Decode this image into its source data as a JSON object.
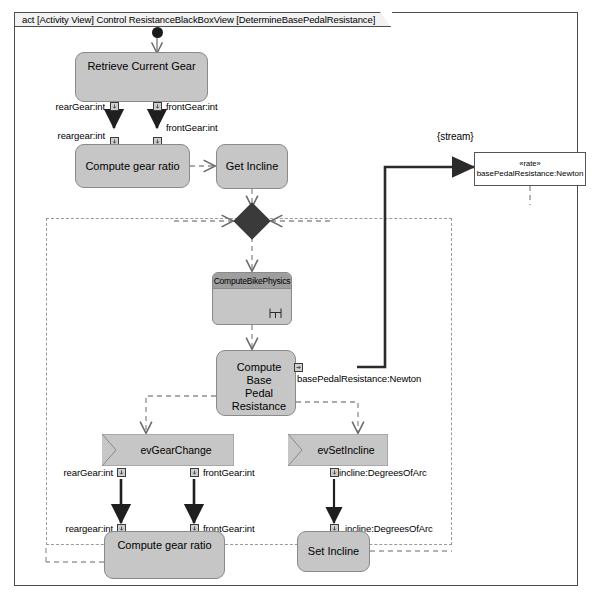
{
  "frame": {
    "label": "act [Activity View] Control ResistanceBlackBoxView [DetermineBasePedalResistance]"
  },
  "nodes": {
    "retrieve_current_gear": "Retrieve Current Gear",
    "compute_gear_ratio_top": "Compute gear ratio",
    "get_incline": "Get Incline",
    "compute_bike_physics": "ComputeBikePhysics",
    "compute_base_pedal_resistance": "Compute Base\nPedal Resistance",
    "compute_base_pedal_resistance_line1": "Compute Base",
    "compute_base_pedal_resistance_line2": "Pedal Resistance",
    "ev_gear_change": "evGearChange",
    "ev_set_incline": "evSetIncline",
    "compute_gear_ratio_bottom": "Compute gear ratio",
    "set_incline": "Set Incline"
  },
  "object_node": {
    "stereotype": "«rate»",
    "name": "basePedalResistance:Newton"
  },
  "annotations": {
    "stream": "{stream}"
  },
  "pins": {
    "top_out_rear": "rearGear:int",
    "top_out_front": "frontGear:int",
    "top_in_rear": "reargear:int",
    "top_in_front": "frontGear:int",
    "base_resistance_out": "basePedalResistance:Newton",
    "bottom_out_rear": "rearGear:int",
    "bottom_out_front": "frontGear:int",
    "bottom_in_rear": "reargear:int",
    "bottom_in_front": "frontGear:int",
    "incline_out": "incline:DegreesOfArc",
    "incline_in": "incline:DegreesOfArc"
  },
  "colors": {
    "node_fill": "#c6c6c6",
    "node_stroke": "#8a8a8a",
    "title_band": "#9e9e9e",
    "diamond": "#3a3a3a",
    "frame_stroke": "#4d4d4d",
    "dashed": "#9a9a9a",
    "background": "#ffffff"
  }
}
